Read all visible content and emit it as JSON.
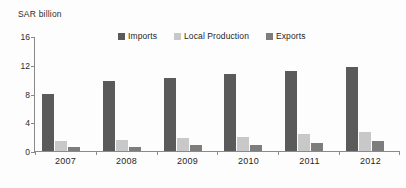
{
  "chart_data": {
    "type": "bar",
    "title": "",
    "subtitle": "",
    "xlabel": "",
    "ylabel": "SAR billion",
    "ylim": [
      0,
      16
    ],
    "yticks": [
      0,
      4,
      8,
      12,
      16
    ],
    "grid": false,
    "legend_position": "top-center",
    "categories": [
      "2007",
      "2008",
      "2009",
      "2010",
      "2011",
      "2012"
    ],
    "series": [
      {
        "name": "Imports",
        "color": "#5a5a5a",
        "values": [
          7.9,
          9.7,
          10.2,
          10.7,
          11.2,
          11.7
        ]
      },
      {
        "name": "Local Production",
        "color": "#c8c8c8",
        "values": [
          1.4,
          1.5,
          1.8,
          2.0,
          2.3,
          2.6
        ]
      },
      {
        "name": "Exports",
        "color": "#7d7d7d",
        "values": [
          0.6,
          0.6,
          0.8,
          0.9,
          1.1,
          1.4
        ]
      }
    ]
  },
  "axis": {
    "y_title": "SAR billion",
    "tick_labels": [
      "16",
      "12",
      "8",
      "4",
      "0"
    ]
  },
  "legend": {
    "items": [
      {
        "label": "Imports",
        "color": "#5a5a5a"
      },
      {
        "label": "Local Production",
        "color": "#c8c8c8"
      },
      {
        "label": "Exports",
        "color": "#7d7d7d"
      }
    ]
  },
  "caption": ""
}
